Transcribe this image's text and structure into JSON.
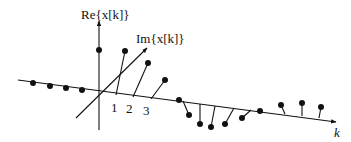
{
  "diagram": {
    "axes": {
      "real_label": "Re{x[k]}",
      "imag_label": "Im{x[k]}",
      "k_label": "k",
      "tick_labels": [
        "1",
        "2",
        "3"
      ]
    },
    "colors": {
      "ink": "#111111",
      "background": "#ffffff"
    }
  }
}
